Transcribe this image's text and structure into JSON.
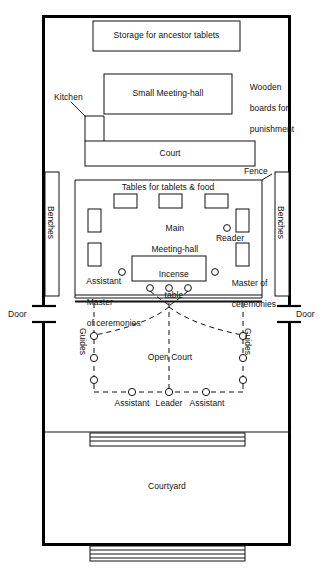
{
  "figure": {
    "type": "floor-plan"
  },
  "rooms": {
    "storage": "Storage for ancestor tablets",
    "small_meeting_hall": "Small Meeting-hall",
    "kitchen": "Kitchen",
    "court": "Court",
    "main_meeting_hall_line1": "Main",
    "main_meeting_hall_line2": "Meeting-hall",
    "open_court": "Open Court",
    "courtyard": "Courtyard"
  },
  "annotations": {
    "wooden_boards_line1": "Wooden",
    "wooden_boards_line2": "boards for",
    "wooden_boards_line3": "punishment",
    "fence": "Fence",
    "tables": "Tables for tablets & food",
    "incense_line1": "Incense",
    "incense_line2": "table",
    "benches_left": "Benches",
    "benches_right": "Benches",
    "door_left": "Door",
    "door_right": "Door",
    "guides_left": "Guides",
    "guides_right": "Guides"
  },
  "participants": {
    "reader": "Reader",
    "assistant_master_line1": "Assistant",
    "assistant_master_line2": "Master",
    "assistant_master_line3": "of ceremonies",
    "master_line1": "Master of",
    "master_line2": "ceremonies",
    "assistant_left": "Assistant",
    "leader": "Leader",
    "assistant_right": "Assistant"
  },
  "colors": {
    "ink": "#111111",
    "paper": "#ffffff",
    "wall": "#000000"
  }
}
